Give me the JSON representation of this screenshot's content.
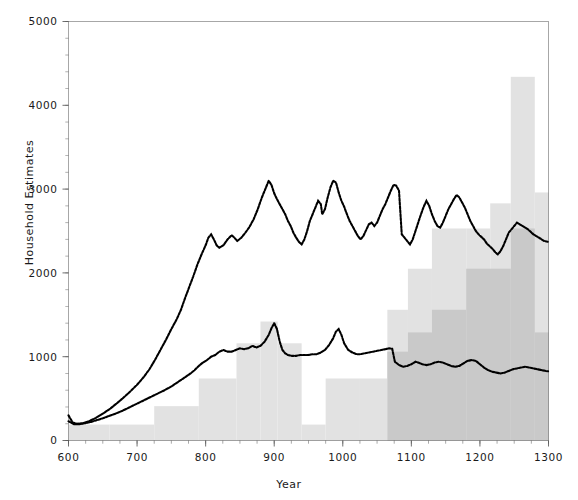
{
  "chart_data": {
    "type": "bar",
    "title": "",
    "subtitle": "",
    "xlabel": "Year",
    "ylabel": "Household Estimates",
    "xlim": [
      600,
      1300
    ],
    "ylim": [
      0,
      5000
    ],
    "xticks": [
      600,
      700,
      800,
      900,
      1000,
      1100,
      1200,
      1300
    ],
    "xtick_labels": [
      "600",
      "700",
      "800",
      "900",
      "1000",
      "1100",
      "1200",
      "1300"
    ],
    "yticks": [
      0,
      1000,
      2000,
      3000,
      4000,
      5000
    ],
    "ytick_labels": [
      "0",
      "1000",
      "2000",
      "3000",
      "4000",
      "5000"
    ],
    "minor_xtick_step": 25,
    "minor_ytick_step": 200,
    "grid": false,
    "legend": "none",
    "frame": true,
    "colors": {
      "bars_light": "#e2e2e2",
      "bars_dark": "#c9c9c9",
      "line": "#000000",
      "axis": "#4d4d4d",
      "text": "#1a1a1a",
      "background": "#ffffff"
    },
    "series": [
      {
        "name": "Archaeological household estimates (light steps)",
        "type": "step-bar",
        "color": "#e2e2e2",
        "bins": [
          {
            "x0": 600,
            "x1": 660,
            "value": 190
          },
          {
            "x0": 660,
            "x1": 725,
            "value": 190
          },
          {
            "x0": 725,
            "x1": 790,
            "value": 410
          },
          {
            "x0": 790,
            "x1": 845,
            "value": 740
          },
          {
            "x0": 845,
            "x1": 880,
            "value": 1160
          },
          {
            "x0": 880,
            "x1": 905,
            "value": 1420
          },
          {
            "x0": 905,
            "x1": 940,
            "value": 1160
          },
          {
            "x0": 940,
            "x1": 975,
            "value": 190
          },
          {
            "x0": 975,
            "x1": 1025,
            "value": 740
          },
          {
            "x0": 1025,
            "x1": 1065,
            "value": 740
          },
          {
            "x0": 1065,
            "x1": 1095,
            "value": 1560
          },
          {
            "x0": 1095,
            "x1": 1130,
            "value": 2050
          },
          {
            "x0": 1130,
            "x1": 1180,
            "value": 2530
          },
          {
            "x0": 1180,
            "x1": 1215,
            "value": 2530
          },
          {
            "x0": 1215,
            "x1": 1245,
            "value": 2830
          },
          {
            "x0": 1245,
            "x1": 1280,
            "value": 4340
          },
          {
            "x0": 1280,
            "x1": 1300,
            "value": 2960
          }
        ]
      },
      {
        "name": "Documentary household estimates (dark steps)",
        "type": "step-bar",
        "color": "#c9c9c9",
        "bins": [
          {
            "x0": 1065,
            "x1": 1095,
            "value": 1060
          },
          {
            "x0": 1095,
            "x1": 1130,
            "value": 1290
          },
          {
            "x0": 1130,
            "x1": 1180,
            "value": 1560
          },
          {
            "x0": 1180,
            "x1": 1245,
            "value": 2050
          },
          {
            "x0": 1245,
            "x1": 1280,
            "value": 2530
          },
          {
            "x0": 1280,
            "x1": 1300,
            "value": 1290
          }
        ]
      },
      {
        "name": "Upper estimate (dotted line)",
        "type": "line",
        "style": "dotted",
        "color": "#000000",
        "points": [
          [
            600,
            300
          ],
          [
            606,
            215
          ],
          [
            612,
            200
          ],
          [
            620,
            205
          ],
          [
            630,
            230
          ],
          [
            640,
            270
          ],
          [
            650,
            320
          ],
          [
            660,
            375
          ],
          [
            670,
            440
          ],
          [
            680,
            510
          ],
          [
            690,
            585
          ],
          [
            700,
            665
          ],
          [
            710,
            760
          ],
          [
            718,
            850
          ],
          [
            726,
            960
          ],
          [
            734,
            1080
          ],
          [
            742,
            1200
          ],
          [
            750,
            1330
          ],
          [
            758,
            1450
          ],
          [
            764,
            1560
          ],
          [
            770,
            1700
          ],
          [
            776,
            1830
          ],
          [
            782,
            1960
          ],
          [
            788,
            2100
          ],
          [
            794,
            2220
          ],
          [
            800,
            2330
          ],
          [
            804,
            2420
          ],
          [
            808,
            2460
          ],
          [
            812,
            2400
          ],
          [
            816,
            2330
          ],
          [
            820,
            2300
          ],
          [
            826,
            2330
          ],
          [
            832,
            2400
          ],
          [
            838,
            2450
          ],
          [
            842,
            2420
          ],
          [
            846,
            2380
          ],
          [
            852,
            2420
          ],
          [
            858,
            2480
          ],
          [
            864,
            2550
          ],
          [
            870,
            2640
          ],
          [
            876,
            2760
          ],
          [
            882,
            2900
          ],
          [
            888,
            3020
          ],
          [
            892,
            3100
          ],
          [
            896,
            3050
          ],
          [
            900,
            2950
          ],
          [
            904,
            2880
          ],
          [
            908,
            2820
          ],
          [
            912,
            2760
          ],
          [
            916,
            2700
          ],
          [
            920,
            2620
          ],
          [
            924,
            2560
          ],
          [
            928,
            2480
          ],
          [
            932,
            2420
          ],
          [
            936,
            2370
          ],
          [
            940,
            2340
          ],
          [
            944,
            2400
          ],
          [
            948,
            2500
          ],
          [
            952,
            2620
          ],
          [
            956,
            2700
          ],
          [
            960,
            2780
          ],
          [
            964,
            2860
          ],
          [
            968,
            2820
          ],
          [
            970,
            2700
          ],
          [
            974,
            2760
          ],
          [
            978,
            2900
          ],
          [
            982,
            3020
          ],
          [
            986,
            3100
          ],
          [
            990,
            3080
          ],
          [
            994,
            2960
          ],
          [
            998,
            2860
          ],
          [
            1002,
            2790
          ],
          [
            1006,
            2700
          ],
          [
            1010,
            2620
          ],
          [
            1014,
            2560
          ],
          [
            1018,
            2500
          ],
          [
            1022,
            2440
          ],
          [
            1026,
            2400
          ],
          [
            1030,
            2440
          ],
          [
            1034,
            2510
          ],
          [
            1038,
            2580
          ],
          [
            1042,
            2600
          ],
          [
            1046,
            2560
          ],
          [
            1050,
            2600
          ],
          [
            1054,
            2680
          ],
          [
            1058,
            2760
          ],
          [
            1062,
            2820
          ],
          [
            1066,
            2900
          ],
          [
            1070,
            2980
          ],
          [
            1074,
            3050
          ],
          [
            1078,
            3040
          ],
          [
            1082,
            2980
          ],
          [
            1086,
            2460
          ],
          [
            1090,
            2420
          ],
          [
            1094,
            2380
          ],
          [
            1098,
            2340
          ],
          [
            1102,
            2400
          ],
          [
            1106,
            2500
          ],
          [
            1110,
            2600
          ],
          [
            1114,
            2700
          ],
          [
            1118,
            2790
          ],
          [
            1122,
            2860
          ],
          [
            1126,
            2800
          ],
          [
            1130,
            2700
          ],
          [
            1134,
            2620
          ],
          [
            1138,
            2560
          ],
          [
            1142,
            2540
          ],
          [
            1146,
            2600
          ],
          [
            1150,
            2680
          ],
          [
            1154,
            2760
          ],
          [
            1158,
            2820
          ],
          [
            1162,
            2880
          ],
          [
            1166,
            2930
          ],
          [
            1170,
            2900
          ],
          [
            1174,
            2840
          ],
          [
            1178,
            2780
          ],
          [
            1182,
            2700
          ],
          [
            1186,
            2620
          ],
          [
            1190,
            2560
          ],
          [
            1194,
            2500
          ],
          [
            1198,
            2460
          ],
          [
            1202,
            2430
          ],
          [
            1206,
            2400
          ],
          [
            1210,
            2350
          ],
          [
            1214,
            2320
          ],
          [
            1218,
            2290
          ],
          [
            1222,
            2250
          ],
          [
            1226,
            2220
          ],
          [
            1230,
            2260
          ],
          [
            1234,
            2320
          ],
          [
            1238,
            2400
          ],
          [
            1242,
            2480
          ],
          [
            1246,
            2520
          ],
          [
            1250,
            2560
          ],
          [
            1254,
            2600
          ],
          [
            1258,
            2580
          ],
          [
            1262,
            2560
          ],
          [
            1266,
            2540
          ],
          [
            1270,
            2520
          ],
          [
            1274,
            2490
          ],
          [
            1278,
            2460
          ],
          [
            1282,
            2440
          ],
          [
            1286,
            2420
          ],
          [
            1290,
            2400
          ],
          [
            1294,
            2380
          ],
          [
            1300,
            2370
          ]
        ]
      },
      {
        "name": "Lower estimate (dotted line)",
        "type": "line",
        "style": "dotted",
        "color": "#000000",
        "points": [
          [
            600,
            230
          ],
          [
            608,
            195
          ],
          [
            616,
            195
          ],
          [
            624,
            205
          ],
          [
            632,
            220
          ],
          [
            640,
            240
          ],
          [
            650,
            265
          ],
          [
            660,
            295
          ],
          [
            670,
            325
          ],
          [
            680,
            360
          ],
          [
            690,
            400
          ],
          [
            700,
            440
          ],
          [
            710,
            480
          ],
          [
            720,
            520
          ],
          [
            730,
            560
          ],
          [
            740,
            600
          ],
          [
            750,
            645
          ],
          [
            760,
            700
          ],
          [
            770,
            755
          ],
          [
            778,
            800
          ],
          [
            784,
            840
          ],
          [
            790,
            890
          ],
          [
            796,
            930
          ],
          [
            802,
            960
          ],
          [
            808,
            1000
          ],
          [
            814,
            1020
          ],
          [
            820,
            1060
          ],
          [
            826,
            1080
          ],
          [
            832,
            1060
          ],
          [
            838,
            1060
          ],
          [
            844,
            1080
          ],
          [
            850,
            1100
          ],
          [
            856,
            1090
          ],
          [
            862,
            1100
          ],
          [
            868,
            1130
          ],
          [
            874,
            1110
          ],
          [
            880,
            1130
          ],
          [
            886,
            1180
          ],
          [
            892,
            1260
          ],
          [
            896,
            1340
          ],
          [
            900,
            1400
          ],
          [
            904,
            1330
          ],
          [
            908,
            1180
          ],
          [
            912,
            1080
          ],
          [
            916,
            1040
          ],
          [
            920,
            1020
          ],
          [
            926,
            1010
          ],
          [
            932,
            1010
          ],
          [
            938,
            1020
          ],
          [
            944,
            1020
          ],
          [
            950,
            1020
          ],
          [
            956,
            1030
          ],
          [
            962,
            1030
          ],
          [
            968,
            1050
          ],
          [
            974,
            1080
          ],
          [
            980,
            1140
          ],
          [
            986,
            1220
          ],
          [
            990,
            1300
          ],
          [
            994,
            1330
          ],
          [
            998,
            1260
          ],
          [
            1002,
            1160
          ],
          [
            1008,
            1080
          ],
          [
            1014,
            1050
          ],
          [
            1020,
            1030
          ],
          [
            1026,
            1030
          ],
          [
            1032,
            1040
          ],
          [
            1038,
            1050
          ],
          [
            1044,
            1060
          ],
          [
            1050,
            1070
          ],
          [
            1056,
            1080
          ],
          [
            1062,
            1090
          ],
          [
            1068,
            1100
          ],
          [
            1072,
            1095
          ],
          [
            1076,
            940
          ],
          [
            1082,
            900
          ],
          [
            1088,
            880
          ],
          [
            1094,
            890
          ],
          [
            1100,
            910
          ],
          [
            1106,
            940
          ],
          [
            1110,
            930
          ],
          [
            1116,
            910
          ],
          [
            1122,
            900
          ],
          [
            1128,
            910
          ],
          [
            1134,
            930
          ],
          [
            1140,
            940
          ],
          [
            1146,
            930
          ],
          [
            1152,
            910
          ],
          [
            1158,
            890
          ],
          [
            1164,
            880
          ],
          [
            1170,
            890
          ],
          [
            1176,
            920
          ],
          [
            1182,
            950
          ],
          [
            1188,
            960
          ],
          [
            1194,
            950
          ],
          [
            1200,
            910
          ],
          [
            1206,
            870
          ],
          [
            1212,
            840
          ],
          [
            1218,
            820
          ],
          [
            1224,
            810
          ],
          [
            1230,
            800
          ],
          [
            1236,
            810
          ],
          [
            1242,
            830
          ],
          [
            1248,
            850
          ],
          [
            1254,
            860
          ],
          [
            1260,
            870
          ],
          [
            1266,
            880
          ],
          [
            1272,
            870
          ],
          [
            1278,
            860
          ],
          [
            1284,
            850
          ],
          [
            1290,
            840
          ],
          [
            1296,
            830
          ],
          [
            1300,
            825
          ]
        ]
      }
    ]
  }
}
